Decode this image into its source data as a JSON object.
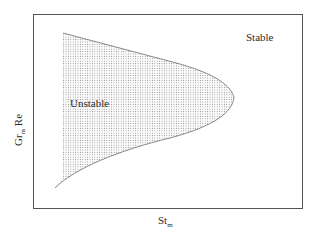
{
  "diagram": {
    "type": "stability-map",
    "x_axis": {
      "label": "St",
      "subscript": "m"
    },
    "y_axis": {
      "label_main": "Gr",
      "subscript": "m",
      "label_suffix": " Re"
    },
    "regions": [
      {
        "name": "unstable",
        "label": "Unstable",
        "fill": "dotted"
      },
      {
        "name": "stable",
        "label": "Stable",
        "fill": "none"
      }
    ],
    "colors": {
      "frame": "#555555",
      "boundary": "#777777",
      "dots": "#9a9a9a",
      "text": "#2a2a2a"
    }
  }
}
